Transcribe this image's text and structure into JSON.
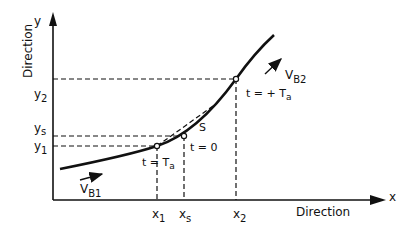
{
  "diagram": {
    "axes": {
      "x_label": "x",
      "y_label": "y",
      "x_title": "Direction",
      "y_title": "Direction"
    },
    "ticks": {
      "x1": "x",
      "x1_sub": "1",
      "xs": "x",
      "xs_sub": "s",
      "x2": "x",
      "x2_sub": "2",
      "y1": "y",
      "y1_sub": "1",
      "ys": "y",
      "ys_sub": "s",
      "y2": "y",
      "y2_sub": "2"
    },
    "annotations": {
      "t_minus": "t = ",
      "t_minus_T": "T",
      "t_minus_sub": "a",
      "t_zero": "t = 0",
      "t_plus": "t = + T",
      "t_plus_sub": "a",
      "s_label": "S",
      "vb1": "V",
      "vb1_sub": "B1",
      "vb2": "V",
      "vb2_sub": "B2"
    },
    "colors": {
      "ink": "#111111",
      "background": "#ffffff"
    }
  }
}
